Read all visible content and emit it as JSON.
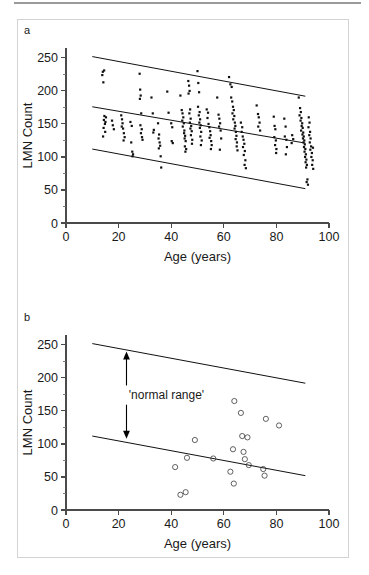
{
  "figure": {
    "panel_a_letter": "a",
    "panel_b_letter": "b"
  },
  "chart_data": [
    {
      "id": "panel-a",
      "type": "scatter",
      "title": "a",
      "xlabel": "Age (years)",
      "ylabel": "LMN Count",
      "xlim": [
        0,
        100
      ],
      "ylim": [
        0,
        265
      ],
      "xticks": [
        0,
        20,
        40,
        60,
        80,
        100
      ],
      "xticks_minor": [
        10,
        30,
        50,
        70,
        90
      ],
      "yticks": [
        0,
        50,
        100,
        150,
        200,
        250
      ],
      "yticks_minor": [
        25,
        75,
        125,
        175,
        225
      ],
      "grid": false,
      "legend": "none",
      "marker": "filled-dot",
      "lines": [
        {
          "name": "upper-limit",
          "x": [
            10,
            91
          ],
          "y": [
            252,
            192
          ]
        },
        {
          "name": "regression-mean",
          "x": [
            10,
            91
          ],
          "y": [
            176,
            121
          ]
        },
        {
          "name": "lower-limit",
          "x": [
            10,
            91
          ],
          "y": [
            112,
            52
          ]
        }
      ],
      "points": [
        [
          14,
          229
        ],
        [
          14.5,
          231
        ],
        [
          13.8,
          224
        ],
        [
          14.2,
          213
        ],
        [
          14.6,
          162
        ],
        [
          14.4,
          156
        ],
        [
          14.8,
          150
        ],
        [
          14.3,
          144
        ],
        [
          14.9,
          138
        ],
        [
          14.1,
          131
        ],
        [
          15.2,
          160
        ],
        [
          15.0,
          153
        ],
        [
          17.5,
          155
        ],
        [
          17.8,
          148
        ],
        [
          18.2,
          142
        ],
        [
          21.0,
          163
        ],
        [
          21.3,
          157
        ],
        [
          21.5,
          151
        ],
        [
          21.2,
          146
        ],
        [
          21.7,
          143
        ],
        [
          22.0,
          136
        ],
        [
          22.3,
          130
        ],
        [
          21.9,
          125
        ],
        [
          24.5,
          153
        ],
        [
          25.0,
          147
        ],
        [
          24.8,
          122
        ],
        [
          25.2,
          108
        ],
        [
          25.5,
          104
        ],
        [
          25.3,
          101
        ],
        [
          28.0,
          226
        ],
        [
          28.2,
          202
        ],
        [
          28.4,
          193
        ],
        [
          28.1,
          188
        ],
        [
          28.6,
          166
        ],
        [
          28.3,
          148
        ],
        [
          28.8,
          142
        ],
        [
          28.5,
          136
        ],
        [
          28.9,
          130
        ],
        [
          29.1,
          126
        ],
        [
          32.5,
          190
        ],
        [
          33.0,
          166
        ],
        [
          33.4,
          141
        ],
        [
          33.2,
          137
        ],
        [
          35.0,
          151
        ],
        [
          35.4,
          134
        ],
        [
          35.2,
          128
        ],
        [
          35.6,
          122
        ],
        [
          35.8,
          117
        ],
        [
          35.3,
          113
        ],
        [
          36.0,
          101
        ],
        [
          36.2,
          84
        ],
        [
          38.5,
          199
        ],
        [
          39.0,
          167
        ],
        [
          40.0,
          151
        ],
        [
          40.4,
          145
        ],
        [
          40.2,
          124
        ],
        [
          40.6,
          121
        ],
        [
          43.5,
          193
        ],
        [
          44.0,
          171
        ],
        [
          44.3,
          166
        ],
        [
          44.6,
          160
        ],
        [
          44.2,
          155
        ],
        [
          44.8,
          151
        ],
        [
          44.4,
          146
        ],
        [
          45.0,
          140
        ],
        [
          44.9,
          136
        ],
        [
          45.3,
          132
        ],
        [
          45.1,
          128
        ],
        [
          45.5,
          124
        ],
        [
          45.2,
          116
        ],
        [
          45.7,
          112
        ],
        [
          45.4,
          108
        ],
        [
          46.5,
          215
        ],
        [
          46.8,
          208
        ],
        [
          47.0,
          200
        ],
        [
          46.6,
          196
        ],
        [
          47.2,
          172
        ],
        [
          46.9,
          166
        ],
        [
          47.4,
          158
        ],
        [
          47.1,
          152
        ],
        [
          47.6,
          147
        ],
        [
          47.3,
          143
        ],
        [
          47.8,
          139
        ],
        [
          47.5,
          133
        ],
        [
          48.0,
          126
        ],
        [
          47.9,
          120
        ],
        [
          50.0,
          230
        ],
        [
          50.3,
          212
        ],
        [
          50.6,
          198
        ],
        [
          50.2,
          176
        ],
        [
          50.8,
          168
        ],
        [
          50.5,
          163
        ],
        [
          51.0,
          157
        ],
        [
          50.7,
          152
        ],
        [
          51.2,
          148
        ],
        [
          50.9,
          144
        ],
        [
          51.4,
          138
        ],
        [
          51.1,
          131
        ],
        [
          51.6,
          125
        ],
        [
          51.3,
          118
        ],
        [
          53.5,
          172
        ],
        [
          54.0,
          167
        ],
        [
          53.8,
          159
        ],
        [
          54.2,
          150
        ],
        [
          54.5,
          145
        ],
        [
          54.8,
          139
        ],
        [
          55.0,
          133
        ],
        [
          54.6,
          129
        ],
        [
          55.2,
          124
        ],
        [
          55.4,
          118
        ],
        [
          55.1,
          112
        ],
        [
          57.5,
          190
        ],
        [
          58.0,
          164
        ],
        [
          58.3,
          158
        ],
        [
          58.6,
          151
        ],
        [
          58.2,
          146
        ],
        [
          58.8,
          140
        ],
        [
          59.0,
          128
        ],
        [
          58.5,
          111
        ],
        [
          62.0,
          221
        ],
        [
          62.5,
          210
        ],
        [
          63.0,
          206
        ],
        [
          62.8,
          190
        ],
        [
          63.2,
          184
        ],
        [
          63.5,
          176
        ],
        [
          63.8,
          171
        ],
        [
          63.3,
          166
        ],
        [
          64.0,
          162
        ],
        [
          63.6,
          157
        ],
        [
          64.2,
          152
        ],
        [
          64.4,
          147
        ],
        [
          64.1,
          143
        ],
        [
          64.6,
          138
        ],
        [
          64.8,
          132
        ],
        [
          64.5,
          127
        ],
        [
          65.0,
          122
        ],
        [
          64.9,
          116
        ],
        [
          65.2,
          110
        ],
        [
          66.5,
          152
        ],
        [
          67.0,
          145
        ],
        [
          66.8,
          138
        ],
        [
          67.2,
          131
        ],
        [
          67.5,
          126
        ],
        [
          67.8,
          120
        ],
        [
          67.3,
          115
        ],
        [
          68.0,
          109
        ],
        [
          67.6,
          103
        ],
        [
          68.2,
          95
        ],
        [
          67.9,
          88
        ],
        [
          68.4,
          83
        ],
        [
          72.5,
          178
        ],
        [
          73.0,
          165
        ],
        [
          73.3,
          160
        ],
        [
          73.6,
          152
        ],
        [
          73.1,
          146
        ],
        [
          73.8,
          140
        ],
        [
          79.0,
          161
        ],
        [
          79.3,
          147
        ],
        [
          79.6,
          142
        ],
        [
          79.2,
          130
        ],
        [
          79.8,
          125
        ],
        [
          79.5,
          118
        ],
        [
          80.0,
          112
        ],
        [
          79.9,
          106
        ],
        [
          83.0,
          158
        ],
        [
          83.5,
          146
        ],
        [
          83.2,
          131
        ],
        [
          83.8,
          126
        ],
        [
          84.0,
          115
        ],
        [
          83.6,
          104
        ],
        [
          88.5,
          190
        ],
        [
          89.0,
          174
        ],
        [
          89.3,
          168
        ],
        [
          88.8,
          163
        ],
        [
          89.5,
          159
        ],
        [
          89.2,
          155
        ],
        [
          89.8,
          151
        ],
        [
          89.6,
          147
        ],
        [
          90.0,
          144
        ],
        [
          89.4,
          140
        ],
        [
          90.2,
          137
        ],
        [
          89.9,
          134
        ],
        [
          90.4,
          131
        ],
        [
          90.1,
          128
        ],
        [
          90.6,
          125
        ],
        [
          90.3,
          122
        ],
        [
          90.8,
          119
        ],
        [
          90.5,
          115
        ],
        [
          91.0,
          112
        ],
        [
          90.7,
          108
        ],
        [
          91.2,
          104
        ],
        [
          90.9,
          100
        ],
        [
          91.4,
          96
        ],
        [
          91.1,
          92
        ],
        [
          91.6,
          88
        ],
        [
          91.3,
          84
        ],
        [
          91.8,
          66
        ],
        [
          91.5,
          62
        ],
        [
          92.0,
          58
        ],
        [
          92.3,
          160
        ],
        [
          92.6,
          152
        ],
        [
          92.2,
          145
        ],
        [
          92.8,
          138
        ],
        [
          92.5,
          133
        ],
        [
          93.0,
          128
        ],
        [
          92.7,
          122
        ],
        [
          93.2,
          116
        ],
        [
          92.9,
          111
        ],
        [
          93.5,
          106
        ],
        [
          93.3,
          100
        ],
        [
          93.8,
          95
        ],
        [
          93.6,
          88
        ],
        [
          94.0,
          82
        ],
        [
          93.9,
          114
        ],
        [
          86.0,
          133
        ],
        [
          86.4,
          127
        ],
        [
          85.8,
          121
        ]
      ]
    },
    {
      "id": "panel-b",
      "type": "scatter",
      "title": "b",
      "xlabel": "Age (years)",
      "ylabel": "LMN Count",
      "xlim": [
        0,
        100
      ],
      "ylim": [
        0,
        265
      ],
      "xticks": [
        0,
        20,
        40,
        60,
        80,
        100
      ],
      "xticks_minor": [
        10,
        30,
        50,
        70,
        90
      ],
      "yticks": [
        0,
        50,
        100,
        150,
        200,
        250
      ],
      "yticks_minor": [
        25,
        75,
        125,
        175,
        225
      ],
      "grid": false,
      "legend": "none",
      "marker": "open-circle",
      "annotation": {
        "text": "'normal range'",
        "arrow_x": 23,
        "arrow_y_top": 240,
        "arrow_y_bottom": 108
      },
      "lines": [
        {
          "name": "upper-limit",
          "x": [
            10,
            91
          ],
          "y": [
            252,
            192
          ]
        },
        {
          "name": "lower-limit",
          "x": [
            10,
            91
          ],
          "y": [
            112,
            52
          ]
        }
      ],
      "points": [
        [
          41.5,
          65
        ],
        [
          43.5,
          23
        ],
        [
          45.5,
          27
        ],
        [
          46.0,
          79
        ],
        [
          49.0,
          106
        ],
        [
          56.0,
          78
        ],
        [
          62.5,
          58
        ],
        [
          63.5,
          92
        ],
        [
          63.8,
          40
        ],
        [
          64.0,
          165
        ],
        [
          66.5,
          147
        ],
        [
          67.0,
          112
        ],
        [
          67.5,
          88
        ],
        [
          68.0,
          77
        ],
        [
          69.0,
          110
        ],
        [
          69.5,
          68
        ],
        [
          75.0,
          62
        ],
        [
          75.5,
          52
        ],
        [
          76.0,
          138
        ],
        [
          81.0,
          128
        ]
      ]
    }
  ]
}
